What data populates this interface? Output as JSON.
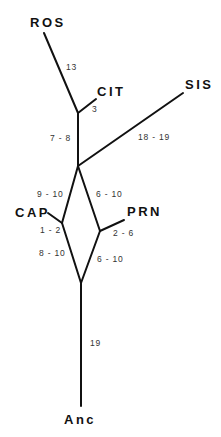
{
  "diagram": {
    "type": "phylogenetic-tree",
    "taxa": {
      "ros": "ROS",
      "cit": "CIT",
      "sis": "SIS",
      "cap": "CAP",
      "prn": "PRN",
      "anc": "Anc"
    },
    "branch_lengths": {
      "ros": "13",
      "cit": "3",
      "internal_upper": "7 - 8",
      "sis": "18 - 19",
      "cap_upper": "9 - 10",
      "prn_upper": "6 - 10",
      "cap": "1 - 2",
      "prn": "2 - 6",
      "cap_lower": "8 - 10",
      "prn_lower": "6 - 10",
      "root": "19"
    },
    "edge_color": "#111111"
  }
}
